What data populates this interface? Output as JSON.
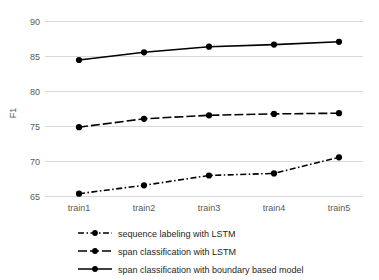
{
  "chart_data": {
    "type": "line",
    "title": "",
    "xlabel": "",
    "ylabel": "F1",
    "categories": [
      "train1",
      "train2",
      "train3",
      "train4",
      "train5"
    ],
    "ylim": [
      65,
      90
    ],
    "yticks": [
      65,
      70,
      75,
      80,
      85,
      90
    ],
    "grid": "horizontal",
    "legend_position": "bottom",
    "series": [
      {
        "name": "sequence labeling with LSTM",
        "values": [
          65.4,
          66.6,
          68.0,
          68.3,
          70.6
        ],
        "style": "dash-dot",
        "color": "#000000",
        "marker": "circle"
      },
      {
        "name": "span classification with LSTM",
        "values": [
          74.9,
          76.1,
          76.6,
          76.8,
          76.9
        ],
        "style": "dashed",
        "color": "#000000",
        "marker": "circle"
      },
      {
        "name": "span classification with boundary based model",
        "values": [
          84.5,
          85.6,
          86.4,
          86.7,
          87.1
        ],
        "style": "solid",
        "color": "#000000",
        "marker": "circle"
      }
    ]
  },
  "axis": {
    "y_tick_labels": [
      "90",
      "85",
      "80",
      "75",
      "70",
      "65"
    ],
    "y_axis_title": "F1",
    "x_tick_labels": [
      "train1",
      "train2",
      "train3",
      "train4",
      "train5"
    ]
  },
  "legend": {
    "items": [
      {
        "label": "sequence labeling with LSTM",
        "style": "dash-dot"
      },
      {
        "label": "span classification with LSTM",
        "style": "dashed"
      },
      {
        "label": "span classification with boundary based model",
        "style": "solid"
      }
    ]
  },
  "colors": {
    "series": "#000000",
    "grid": "#d9d9d9",
    "tick_text": "#595959",
    "legend_text": "#262626",
    "background": "#ffffff"
  }
}
